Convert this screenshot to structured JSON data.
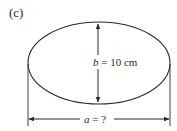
{
  "figure": {
    "panel_label": "(c)",
    "shape": "ellipse",
    "b_label": {
      "var": "b",
      "rest": " = 10 cm"
    },
    "a_label": {
      "var": "a",
      "rest": " = ?"
    }
  },
  "colors": {
    "stroke": "#2a2a2a",
    "background": "#ffffff"
  }
}
